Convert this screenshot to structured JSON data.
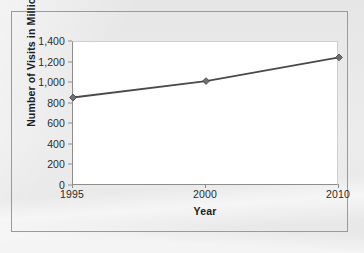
{
  "chart_data": {
    "type": "line",
    "title": "",
    "xlabel": "Year",
    "ylabel": "Number of Visits in Millions",
    "categories": [
      "1995",
      "2000",
      "2010"
    ],
    "values": [
      860,
      1020,
      1250
    ],
    "series": [
      {
        "name": "Number of Visits in Millions",
        "values": [
          860,
          1020,
          1250
        ]
      }
    ],
    "ylim": [
      0,
      1400
    ],
    "y_ticks": [
      0,
      200,
      400,
      600,
      800,
      1000,
      1200,
      1400
    ],
    "y_tick_labels": [
      "0",
      "200",
      "400",
      "600",
      "800",
      "1,000",
      "1,200",
      "1,400"
    ],
    "x_tick_labels": [
      "1995",
      "2000",
      "2010"
    ],
    "grid": false,
    "legend": false,
    "legend_position": "none",
    "marker": "diamond",
    "line_color": "#4a4a4a",
    "marker_color": "#6f6f76",
    "plot_background": "#ffffff",
    "figure_background": "#e9e9e9"
  }
}
